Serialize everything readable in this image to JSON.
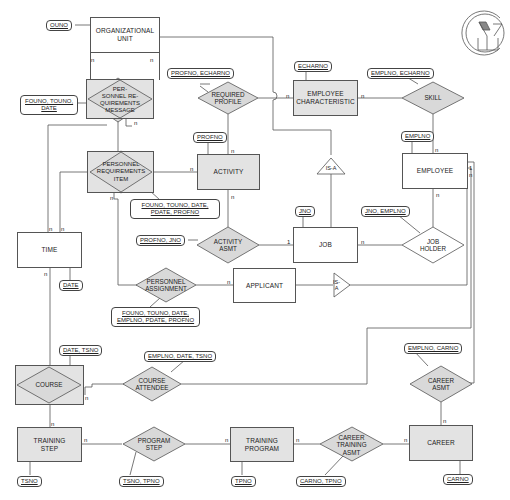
{
  "entities": {
    "organizational_unit": "ORGANIZATIONAL\nUNIT",
    "employee_characteristic": "EMPLOYEE\nCHARACTERISTIC",
    "activity": "ACTIVITY",
    "employee": "EMPLOYEE",
    "time": "TIME",
    "job": "JOB",
    "applicant": "APPLICANT",
    "course": "COURSE",
    "training_step": "TRAINING\nSTEP",
    "training_program": "TRAINING\nPROGRAM",
    "career": "CAREER"
  },
  "relationships": {
    "personnel_requirements_message": "PER-\nSONNEL RE-\nQUIREMENTS\nMESSAGE",
    "required_profile": "REQUIRED\nPROFILE",
    "skill": "SKILL",
    "personnel_requirements_item": "PERSONNEL\nREQUIREMENTS\nITEM",
    "activity_asmt": "ACTIVITY\nASMT",
    "job_holder": "JOB\nHOLDER",
    "personnel_assignment": "PERSONNEL\nASSIGNMENT",
    "course_attendee": "COURSE\nATTENDEE",
    "career_asmt": "CAREER\nASMT",
    "program_step": "PROGRAM\nSTEP",
    "career_training_asmt": "CAREER\nTRAINING\nASMT",
    "isa_job": "IS-A",
    "isa_applicant": "IS-\nA"
  },
  "attributes": {
    "ouno": "OUNO",
    "profno_echarno": "PROFNO, ECHARNO",
    "echarno": "ECHARNO",
    "emplno_echarno": "EMPLNO, ECHARNO",
    "founo_touno_date": "FOUNO, TOUNO,\nDATE",
    "profno": "PROFNO",
    "emplno": "EMPLNO",
    "founo_touno_date_pdate_profno": "FOUNO, TOUNO, DATE,\nPDATE, PROFNO",
    "jno": "JNO",
    "jno_emplno": "JNO, EMPLNO",
    "profno_jno": "PROFNO, JNO",
    "date": "DATE",
    "founo_touno_date_emplno_pdate_profno": "FOUNO, TOUNO, DATE,\nEMPLNO, PDATE, PROFNO",
    "date_tsno": "DATE, TSNO",
    "emplno_date_tsno": "EMPLNO, DATE, TSNO",
    "emplno_carno": "EMPLNO, CARNO",
    "tsno": "TSNO",
    "tsno_tpno": "TSNO, TPNO",
    "tpno": "TPNO",
    "carno_tpno": "CARNO, TPNO",
    "carno": "CARNO"
  },
  "cardinalities": {
    "n": "n",
    "one": "1"
  },
  "colors": {
    "line": "#555555",
    "shaded_fill": "#e3e3e3",
    "diamond_fill": "#d9d9d9"
  }
}
